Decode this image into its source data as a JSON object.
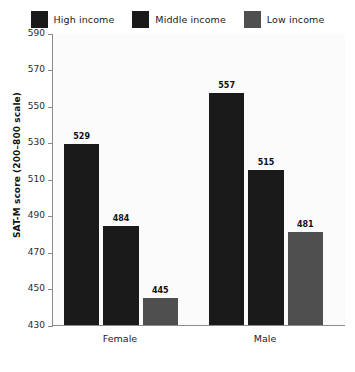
{
  "legend": {
    "items": [
      {
        "label": "High income",
        "color": "#1a1a1a",
        "icon": "legend-swatch-icon"
      },
      {
        "label": "Middle income",
        "color": "#1a1a1a",
        "icon": "legend-swatch-icon"
      },
      {
        "label": "Low income",
        "color": "#4f4f4f",
        "icon": "legend-swatch-icon"
      }
    ]
  },
  "axes": {
    "ylabel": "SAT-M score (200–800 scale)",
    "yticks": [
      "590",
      "570",
      "550",
      "530",
      "510",
      "490",
      "470",
      "450",
      "430"
    ]
  },
  "chart_data": {
    "type": "bar",
    "title": "",
    "xlabel": "",
    "ylabel": "SAT-M score (200–800 scale)",
    "ylim": [
      430,
      590
    ],
    "ytick_step": 20,
    "grid": false,
    "legend_position": "top",
    "categories": [
      "Female",
      "Male"
    ],
    "series": [
      {
        "name": "High income",
        "color": "#1a1a1a",
        "values": [
          529,
          557
        ]
      },
      {
        "name": "Middle income",
        "color": "#1a1a1a",
        "values": [
          484,
          515
        ]
      },
      {
        "name": "Low income",
        "color": "#4f4f4f",
        "values": [
          445,
          481
        ]
      }
    ],
    "data_labels": [
      "529",
      "484",
      "445",
      "557",
      "515",
      "481"
    ]
  }
}
